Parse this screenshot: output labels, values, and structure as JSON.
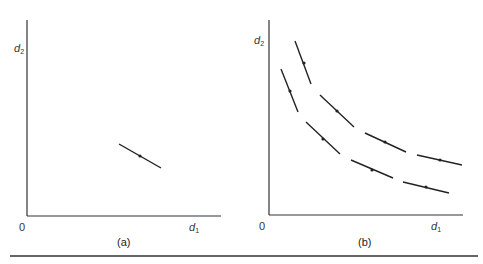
{
  "figure": {
    "panels": [
      {
        "id": "a",
        "caption": "(a)",
        "origin_label": "0",
        "x_axis_label": "d",
        "x_axis_sub": "1",
        "y_axis_label": "d",
        "y_axis_sub": "2"
      },
      {
        "id": "b",
        "caption": "(b)",
        "origin_label": "0",
        "x_axis_label": "d",
        "x_axis_sub": "1",
        "y_axis_label": "d",
        "y_axis_sub": "2"
      }
    ],
    "colors": {
      "line": "#222222",
      "background": "#ffffff"
    }
  },
  "chart_data": [
    {
      "type": "line",
      "title": "(a)",
      "xlabel": "d1",
      "ylabel": "d2",
      "description": "Single short downward-sloping line segment with a midpoint marker",
      "segments": [
        {
          "from": [
            119,
            144
          ],
          "to": [
            161,
            168
          ],
          "marker": [
            140,
            156
          ]
        }
      ]
    },
    {
      "type": "line",
      "title": "(b)",
      "xlabel": "d1",
      "ylabel": "d2",
      "description": "Two convex decreasing curves drawn as dashed tangent segments, each with a midpoint marker",
      "series": [
        {
          "name": "upper curve",
          "segments": [
            {
              "from": [
                295,
                41
              ],
              "to": [
                311,
                84
              ],
              "marker": [
                304,
                63
              ]
            },
            {
              "from": [
                320,
                95
              ],
              "to": [
                354,
                127
              ],
              "marker": [
                337,
                111
              ]
            },
            {
              "from": [
                365,
                133
              ],
              "to": [
                406,
                152
              ],
              "marker": [
                385,
                142
              ]
            },
            {
              "from": [
                417,
                155
              ],
              "to": [
                462,
                165
              ],
              "marker": [
                440,
                160
              ]
            }
          ]
        },
        {
          "name": "lower curve",
          "segments": [
            {
              "from": [
                281,
                69
              ],
              "to": [
                298,
                112
              ],
              "marker": [
                290,
                91
              ]
            },
            {
              "from": [
                306,
                122
              ],
              "to": [
                340,
                154
              ],
              "marker": [
                323,
                139
              ]
            },
            {
              "from": [
                351,
                160
              ],
              "to": [
                393,
                178
              ],
              "marker": [
                372,
                170
              ]
            },
            {
              "from": [
                403,
                182
              ],
              "to": [
                449,
                193
              ],
              "marker": [
                426,
                187
              ]
            }
          ]
        }
      ]
    }
  ]
}
